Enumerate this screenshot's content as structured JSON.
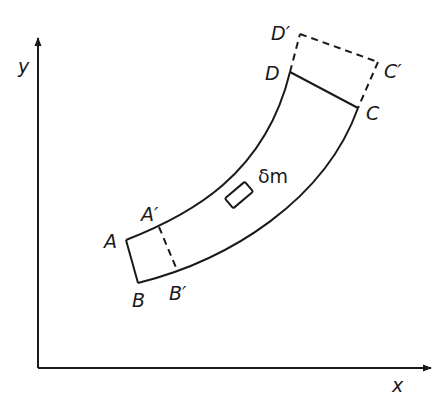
{
  "diagram": {
    "axes": {
      "x_label": "x",
      "y_label": "y"
    },
    "points": {
      "A": "A",
      "B": "B",
      "A_prime": "A′",
      "B_prime": "B′",
      "C": "C",
      "D": "D",
      "C_prime": "C′",
      "D_prime": "D′"
    },
    "element_label": "δm",
    "colors": {
      "stroke": "#1a1a1a",
      "background": "#ffffff"
    }
  }
}
